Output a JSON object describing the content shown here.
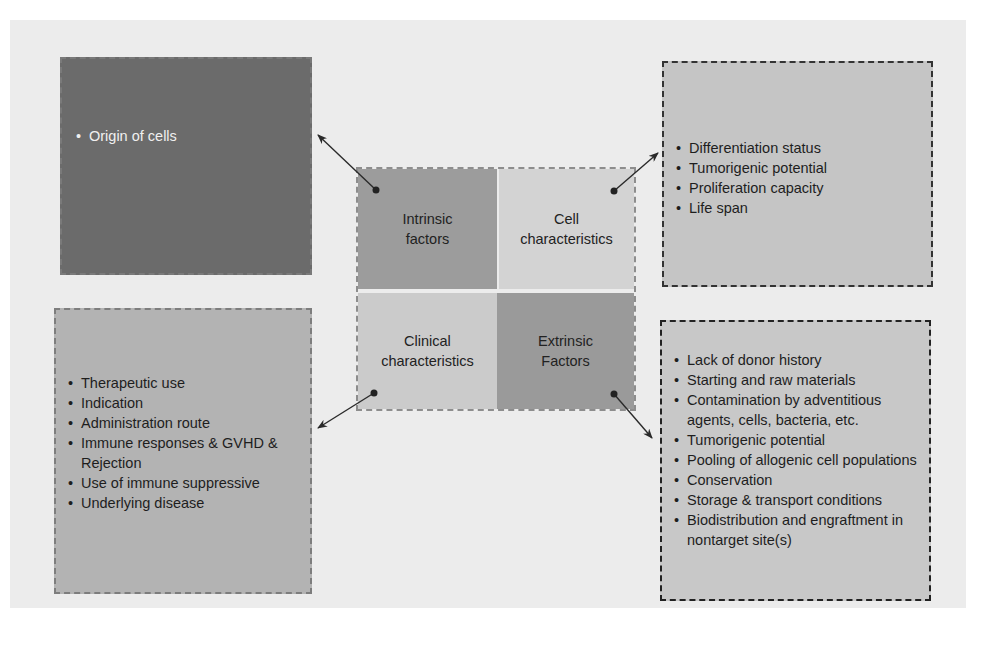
{
  "center": {
    "intrinsic_factors": [
      "Intrinsic",
      "factors"
    ],
    "cell_characteristics": [
      "Cell",
      "characteristics"
    ],
    "clinical_characteristics": [
      "Clinical",
      "characteristics"
    ],
    "extrinsic_factors": [
      "Extrinsic",
      "Factors"
    ]
  },
  "intrinsic_box": {
    "items": [
      "Origin of cells"
    ]
  },
  "cell_box": {
    "items": [
      "Differentiation status",
      "Tumorigenic potential",
      "Proliferation capacity",
      "Life span"
    ]
  },
  "clinical_box": {
    "items": [
      "Therapeutic use",
      "Indication",
      "Administration route",
      "Immune responses & GVHD & Rejection",
      "Use of immune suppressive",
      "Underlying disease"
    ]
  },
  "extrinsic_box": {
    "items": [
      "Lack of donor history",
      "Starting and raw materials",
      "Contamination by adventitious agents, cells, bacteria, etc.",
      "Tumorigenic potential",
      "Pooling of allogenic cell populations",
      "Conservation",
      "Storage & transport conditions",
      "Biodistribution and engraftment in nontarget site(s)"
    ]
  },
  "colors": {
    "paper": "#ececec",
    "intrinsic_dark": "#6b6b6b",
    "cell_light": "#c5c5c5",
    "clinical_mid": "#b3b3b3",
    "extrinsic_light": "#c8c8c8",
    "arrow": "#2a2a2a"
  }
}
